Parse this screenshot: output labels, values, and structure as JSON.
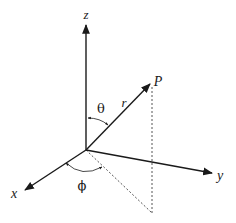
{
  "diagram": {
    "colors": {
      "axis": "#1a1a1a",
      "dashed": "#555555",
      "background": "#ffffff"
    },
    "origin": [
      86,
      150
    ],
    "axes": [
      {
        "name": "z",
        "label": "z",
        "tip": [
          86,
          24
        ],
        "label_pos": [
          86,
          17
        ]
      },
      {
        "name": "y",
        "label": "y",
        "tip": [
          213,
          173
        ],
        "label_pos": [
          220,
          178
        ]
      },
      {
        "name": "x",
        "label": "x",
        "tip": [
          24,
          191
        ],
        "label_pos": [
          14,
          197
        ]
      }
    ],
    "vector": {
      "label_point": "P",
      "label_radius": "r",
      "tip": [
        151,
        83
      ],
      "point_label_pos": [
        157,
        82
      ],
      "radius_label_pos": [
        124,
        104
      ]
    },
    "angles": {
      "polar": {
        "symbol": "θ",
        "label_pos": [
          101,
          111
        ]
      },
      "azimuthal": {
        "symbol": "ϕ",
        "label_pos": [
          82,
          187
        ]
      }
    },
    "projection": {
      "vertical_top": [
        152,
        86
      ],
      "foot": [
        152,
        213
      ]
    }
  }
}
